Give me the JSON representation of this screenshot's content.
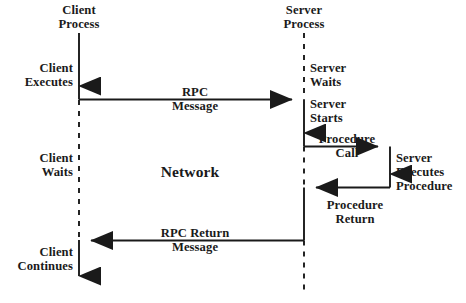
{
  "diagram": {
    "type": "sequence-diagram",
    "colors": {
      "line": "#1a1a1a",
      "text": "#1a1a1a",
      "background": "#ffffff"
    },
    "lifelines": [
      {
        "id": "client",
        "label_line1": "Client",
        "label_line2": "Process",
        "x": 79
      },
      {
        "id": "server",
        "label_line1": "Server",
        "label_line2": "Process",
        "x": 304
      }
    ],
    "center_label": "Network",
    "client_states": [
      {
        "id": "client-executes",
        "line1": "Client",
        "line2": "Executes"
      },
      {
        "id": "client-waits",
        "line1": "Client",
        "line2": "Waits"
      },
      {
        "id": "client-continues",
        "line1": "Client",
        "line2": "Continues"
      }
    ],
    "server_states": [
      {
        "id": "server-waits",
        "line1": "Server",
        "line2": "Waits"
      },
      {
        "id": "server-starts",
        "line1": "Server",
        "line2": "Starts"
      },
      {
        "id": "server-executes-procedure",
        "line1": "Server",
        "line2": "Executes",
        "line3": "Procedure"
      }
    ],
    "messages": [
      {
        "id": "rpc-message",
        "line1": "RPC",
        "line2": "Message",
        "direction": "client-to-server"
      },
      {
        "id": "procedure-call",
        "line1": "Procedure",
        "line2": "Call",
        "direction": "server-to-procedure"
      },
      {
        "id": "procedure-return",
        "line1": "Procedure",
        "line2": "Return",
        "direction": "procedure-to-server"
      },
      {
        "id": "rpc-return-message",
        "line1": "RPC Return",
        "line2": "Message",
        "direction": "server-to-client"
      }
    ]
  }
}
